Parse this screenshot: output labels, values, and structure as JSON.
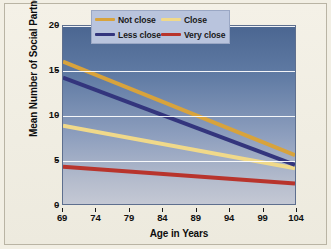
{
  "chart_data": {
    "type": "line",
    "title": "",
    "xlabel": "Age in Years",
    "ylabel": "Mean Number of Social Partners",
    "xlim": [
      69,
      104
    ],
    "ylim": [
      0,
      20
    ],
    "xticks": [
      "69",
      "74",
      "79",
      "84",
      "89",
      "94",
      "99",
      "104"
    ],
    "yticks": [
      "0",
      "5",
      "10",
      "15",
      "20"
    ],
    "grid": "horizontal",
    "legend_position": "top-right-inside",
    "x": [
      69,
      104
    ],
    "series": [
      {
        "name": "Not close",
        "color": "#d8a33c",
        "values": [
          16.0,
          5.5
        ]
      },
      {
        "name": "Close",
        "color": "#f0d98a",
        "values": [
          8.8,
          4.0
        ]
      },
      {
        "name": "Less close",
        "color": "#33357d",
        "values": [
          14.2,
          4.4
        ]
      },
      {
        "name": "Very close",
        "color": "#b8342c",
        "values": [
          4.2,
          2.3
        ]
      }
    ]
  },
  "legend": {
    "items": [
      {
        "label": "Not close"
      },
      {
        "label": "Close"
      },
      {
        "label": "Less close"
      },
      {
        "label": "Very close"
      }
    ]
  },
  "colors": {
    "page_background": "#f2efe4",
    "plot_top": "#4b6691",
    "plot_bottom": "#c4c8d4",
    "gridline": "#ffffff",
    "legend_background": "#b9c4dd",
    "frame_border": "#b9b4a4"
  }
}
